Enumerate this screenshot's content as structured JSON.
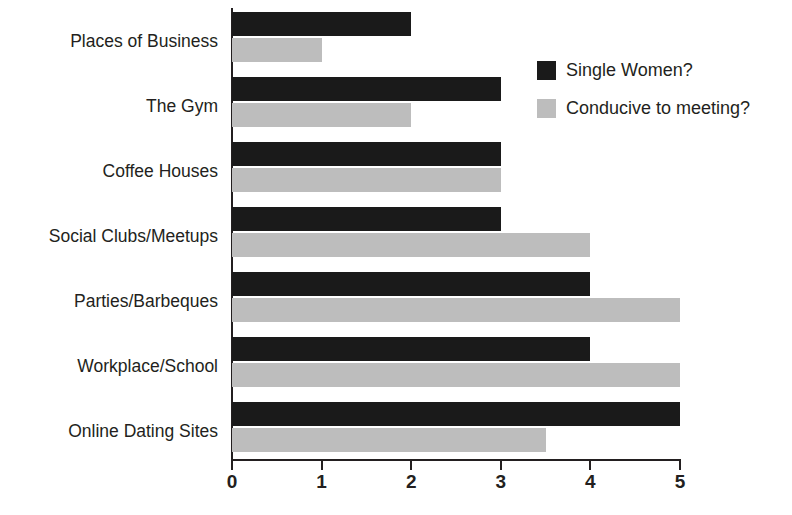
{
  "chart_data": {
    "type": "bar",
    "orientation": "horizontal",
    "title": "",
    "subtitle": "",
    "xlabel": "",
    "ylabel": "",
    "xlim": [
      0,
      5
    ],
    "xticks": [
      "0",
      "1",
      "2",
      "3",
      "4",
      "5"
    ],
    "grid": false,
    "legend_position": "top-right",
    "categories": [
      "Places of Business",
      "The Gym",
      "Coffee Houses",
      "Social Clubs/Meetups",
      "Parties/Barbeques",
      "Workplace/School",
      "Online Dating Sites"
    ],
    "series": [
      {
        "name": "Single Women?",
        "color": "#1a1a1a",
        "values": [
          2,
          3,
          3,
          3,
          4,
          4,
          5
        ]
      },
      {
        "name": "Conducive to meeting?",
        "color": "#bdbdbd",
        "values": [
          1,
          2,
          3,
          4,
          5,
          5,
          3.5
        ]
      }
    ]
  },
  "legend": {
    "items": [
      {
        "label": "Single Women?",
        "swatch": "dark"
      },
      {
        "label": "Conducive to meeting?",
        "swatch": "light"
      }
    ]
  }
}
